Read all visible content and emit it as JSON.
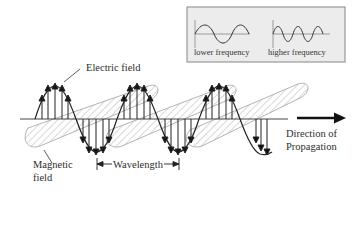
{
  "diagram": {
    "labels": {
      "electric_field": "Electric field",
      "magnetic_field_line1": "Magnetic",
      "magnetic_field_line2": "field",
      "wavelength": "Wavelength",
      "direction_line1": "Direction of",
      "direction_line2": "Propagation"
    },
    "inset": {
      "lower_frequency": "lower frequency",
      "higher_frequency": "higher frequency",
      "background": "#ececec",
      "border": "#9a9a9a"
    },
    "geometry": {
      "axis_y": 119,
      "wave_start_x": 35,
      "wavelength_px": 82,
      "amplitude_px": 33,
      "cycles": 2.85
    },
    "colors": {
      "electric_wave": "#222222",
      "magnetic_hatch": "#a8a8a8",
      "axis": "#444444",
      "arrow": "#1a1a1a"
    }
  }
}
